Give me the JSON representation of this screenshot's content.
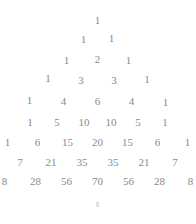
{
  "figure": {
    "kind": "pascals-triangle",
    "background_color": "#ffffff",
    "text_color": "#8a8a8a",
    "row_count": 9,
    "bottom_artifact": "."
  },
  "chart_data": {
    "type": "table",
    "subtitle": "",
    "xlabel": "",
    "ylabel": "",
    "rows": [
      [
        1
      ],
      [
        1,
        1
      ],
      [
        1,
        2,
        1
      ],
      [
        1,
        3,
        3,
        1
      ],
      [
        1,
        4,
        6,
        4,
        1
      ],
      [
        1,
        5,
        10,
        10,
        5,
        1
      ],
      [
        1,
        6,
        15,
        20,
        15,
        6,
        1
      ],
      [
        1,
        7,
        21,
        35,
        35,
        21,
        7,
        1
      ],
      [
        1,
        8,
        28,
        56,
        70,
        56,
        28,
        8,
        1
      ]
    ],
    "row_labels": [
      "0",
      "1",
      "2",
      "3",
      "4",
      "5",
      "6",
      "7",
      "8"
    ],
    "legend": [],
    "grid": false
  },
  "layout": {
    "row_tops": [
      14,
      33,
      54,
      74,
      95,
      116,
      136,
      156,
      175
    ],
    "row_gaps": [
      0,
      14,
      15,
      17,
      18,
      10,
      12,
      13,
      13
    ],
    "cell_widths": [
      14,
      14,
      16,
      16,
      16,
      17,
      18,
      18,
      18
    ],
    "row_jitter": [
      [
        0
      ],
      [
        0,
        -1
      ],
      [
        0,
        -1,
        0
      ],
      [
        -2,
        0,
        0,
        -1
      ],
      [
        -1,
        0,
        0,
        0,
        1
      ],
      [
        0,
        0,
        0,
        0,
        0,
        0
      ],
      [
        0,
        0,
        0,
        0,
        0,
        0,
        0
      ],
      [
        0,
        0,
        0,
        0,
        0,
        0,
        0,
        0
      ],
      [
        0,
        0,
        0,
        0,
        0,
        0,
        0,
        0,
        -4
      ]
    ]
  }
}
